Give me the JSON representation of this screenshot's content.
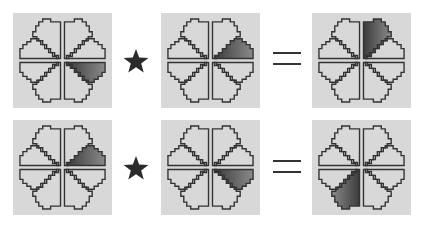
{
  "colors": {
    "panel_bg": "#d8d8d8",
    "outline": "#333333",
    "shade": "#555555",
    "operator": "#2a2a2a"
  },
  "petal_legend": [
    "top-right",
    "right-upper",
    "right-lower",
    "bottom-right",
    "bottom-left",
    "left-lower",
    "left-upper",
    "top-left"
  ],
  "rows": [
    {
      "left": {
        "shaded_petal": "right-lower"
      },
      "operator": "star",
      "right": {
        "shaded_petal": "right-upper"
      },
      "equals": "=",
      "result": {
        "shaded_petal": "top-right"
      }
    },
    {
      "left": {
        "shaded_petal": "right-upper"
      },
      "operator": "star",
      "right": {
        "shaded_petal": "right-lower"
      },
      "equals": "=",
      "result": {
        "shaded_petal": "bottom-left"
      }
    }
  ]
}
